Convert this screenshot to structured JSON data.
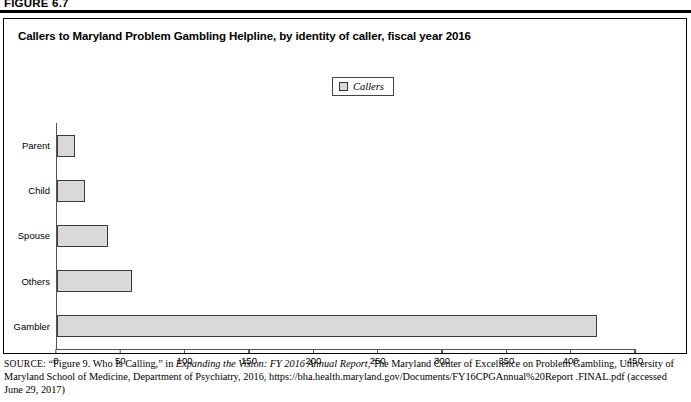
{
  "figure": {
    "label": "FIGURE 6.7"
  },
  "chart_title": "Callers to Maryland Problem Gambling Helpline, by identity of caller, fiscal year 2016",
  "legend": {
    "position": "top-center",
    "entries": [
      {
        "label": "Callers",
        "swatch_color": "#d9d9d9",
        "swatch_border": "#333333"
      }
    ]
  },
  "colors": {
    "bar_fill": "#d9d9d9",
    "bar_border": "#3a3a3a",
    "axis": "#555555",
    "frame": "#000000",
    "text": "#000000"
  },
  "chart_data": {
    "type": "bar",
    "orientation": "horizontal",
    "title": "Callers to Maryland Problem Gambling Helpline, by identity of caller, fiscal year 2016",
    "xlabel": "",
    "ylabel": "",
    "categories": [
      "Parent",
      "Child",
      "Spouse",
      "Others",
      "Gambler"
    ],
    "series": [
      {
        "name": "Callers",
        "values": [
          14,
          22,
          40,
          58,
          420
        ]
      }
    ],
    "values": [
      14,
      22,
      40,
      58,
      420
    ],
    "xlim": [
      0,
      450
    ],
    "xticks": [
      0,
      50,
      100,
      150,
      200,
      250,
      300,
      350,
      400,
      450
    ],
    "xtick_labels": [
      "0",
      "50",
      "100",
      "150",
      "200",
      "250",
      "300",
      "350",
      "400",
      "450"
    ],
    "grid": false,
    "legend_position": "top-center"
  },
  "source": {
    "prefix": "SOURCE:",
    "part1": " “Figure 9. Who Is Calling,” in ",
    "italic1": "Expanding the Vision: FY 2016 Annual Report",
    "part2": ", The Maryland Center of Excellence on Problem Gambling, University of Maryland School of Medicine, Department of Psychiatry, 2016, https://bha.health.maryland.gov/Documents/FY16CPGAnnual%20Report .FINAL.pdf (accessed June 29, 2017)"
  }
}
